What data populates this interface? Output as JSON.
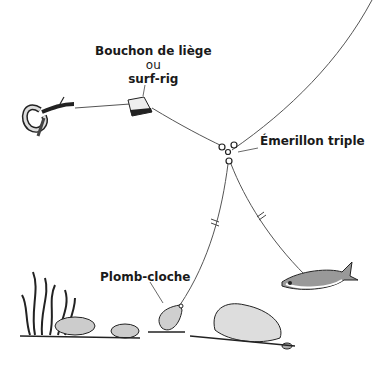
{
  "diagram": {
    "labels": {
      "float_line1": "Bouchon de liège",
      "float_or": "ou",
      "float_line2": "surf-rig",
      "swivel": "Émerillon triple",
      "sinker": "Plomb-cloche"
    },
    "elements": [
      "worm-bait",
      "cork-float",
      "triple-swivel",
      "bell-sinker",
      "baitfish",
      "seaweed",
      "rocks",
      "main-line"
    ],
    "colors": {
      "ink": "#1a1a1a",
      "line": "#555555",
      "background": "#ffffff"
    }
  }
}
